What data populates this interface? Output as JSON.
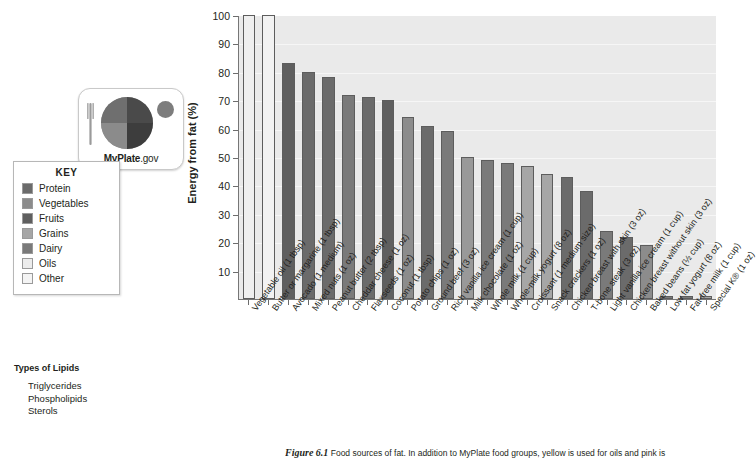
{
  "figure": {
    "caption_number": "Figure 6.1",
    "caption_text": "Food sources of fat. In addition to MyPlate food groups, yellow is used for oils and pink is"
  },
  "logo": {
    "name_bold": "MyPlate",
    "name_rest": ".gov",
    "fork_icon": "fork-icon",
    "plate_icon": "plate-icon",
    "cup_icon": "dairy-cup-icon"
  },
  "key": {
    "title": "KEY",
    "items": [
      {
        "label": "Protein",
        "color": "#6b6b6b"
      },
      {
        "label": "Vegetables",
        "color": "#8c8c8c"
      },
      {
        "label": "Fruits",
        "color": "#5f5f5f"
      },
      {
        "label": "Grains",
        "color": "#a6a6a6"
      },
      {
        "label": "Dairy",
        "color": "#7a7a7a"
      },
      {
        "label": "Oils",
        "color": "#ececec"
      },
      {
        "label": "Other",
        "color": "#f4f4f4"
      }
    ]
  },
  "lipids": {
    "title": "Types of Lipids",
    "items": [
      "Triglycerides",
      "Phospholipids",
      "Sterols"
    ]
  },
  "chart_data": {
    "type": "bar",
    "title": "",
    "xlabel": "",
    "ylabel": "Energy from fat (%)",
    "ylim": [
      0,
      100
    ],
    "yticks": [
      10,
      20,
      30,
      40,
      50,
      60,
      70,
      80,
      90,
      100
    ],
    "grid": true,
    "legend_position": "left-outside",
    "categories": [
      "Vegetable oil (1 tbsp)",
      "Butter or margarine (1 tbsp)",
      "Avocado (1 medium)",
      "Mixed nuts (1 oz)",
      "Peanut butter (2 tbsp)",
      "Cheddar cheese (1 oz)",
      "Flaxseeds (1 oz)",
      "Coconut (1 tbsp)",
      "Potato chips (1 oz)",
      "Ground beef (3 oz)",
      "Rich vanilla ice cream (1 cup)",
      "Milk chocolate (1 oz)",
      "Whole milk (1 cup)",
      "Whole-milk yogurt (8 oz)",
      "Croissant (1 medium size)",
      "Snack crackers (1 oz)",
      "Chicken breast with skin (3 oz)",
      "T-bone steak (3 oz)",
      "Light vanilla ice cream (1 cup)",
      "Chicken breast without skin (3 oz)",
      "Baked beans (½ cup)",
      "Low fat yogurt (8 oz)",
      "Fat-free milk (1 cup)",
      "Special K® (1 oz)"
    ],
    "values": [
      100,
      100,
      83,
      80,
      78,
      72,
      71,
      70,
      64,
      61,
      59,
      50,
      49,
      48,
      47,
      44,
      43,
      38,
      24,
      22,
      19,
      1,
      1,
      1
    ],
    "group": [
      "Oils",
      "Oils",
      "Fruits",
      "Protein",
      "Protein",
      "Dairy",
      "Protein",
      "Fruits",
      "Vegetables",
      "Protein",
      "Dairy",
      "Other",
      "Dairy",
      "Dairy",
      "Grains",
      "Grains",
      "Protein",
      "Protein",
      "Dairy",
      "Protein",
      "Vegetables",
      "Dairy",
      "Dairy",
      "Grains"
    ],
    "bar_colors": [
      "#efefef",
      "#f2f2f2",
      "#5f5f5f",
      "#6b6b6b",
      "#6b6b6b",
      "#7a7a7a",
      "#6b6b6b",
      "#5f5f5f",
      "#8c8c8c",
      "#6b6b6b",
      "#7a7a7a",
      "#999999",
      "#7a7a7a",
      "#7a7a7a",
      "#a6a6a6",
      "#a6a6a6",
      "#6b6b6b",
      "#6b6b6b",
      "#7a7a7a",
      "#6b6b6b",
      "#8c8c8c",
      "#7a7a7a",
      "#7a7a7a",
      "#a6a6a6"
    ]
  }
}
